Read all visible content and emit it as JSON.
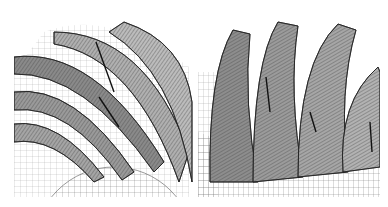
{
  "figure": {
    "panels": [
      {
        "id": "left",
        "subject": "spiral bevel gear tooth mesh - top view"
      },
      {
        "id": "right",
        "subject": "gear teeth finite element mesh - perspective view"
      }
    ],
    "colors": {
      "background": "#ffffff",
      "mesh_line": "#333333",
      "surface": "#9a9a9a",
      "shadow": "#3a3a3a"
    }
  }
}
